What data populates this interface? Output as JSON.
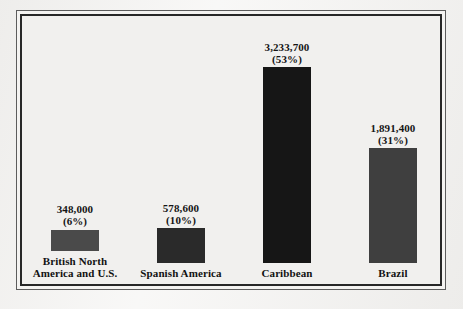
{
  "chart_data": {
    "type": "bar",
    "title": "",
    "subtitle": "",
    "xlabel": "",
    "ylabel": "",
    "grid": false,
    "legend": "none",
    "ylim": [
      0,
      3400000
    ],
    "categories": [
      "British North\nAmerica and U.S.",
      "Spanish America",
      "Caribbean",
      "Brazil"
    ],
    "values": [
      348000,
      578600,
      3233700,
      1891400
    ],
    "value_labels": [
      "348,000",
      "578,600",
      "3,233,700",
      "1,891,400"
    ],
    "percent_labels": [
      "(6%)",
      "(10%)",
      "(53%)",
      "(31%)"
    ],
    "percents": [
      6,
      10,
      53,
      31
    ],
    "bar_colors": [
      "#4a4a4a",
      "#2a2a2a",
      "#161616",
      "#3f3f3f"
    ]
  },
  "figure": {
    "background_color": "#f2f1ef",
    "frame_outer_color": "#5c5c5c",
    "frame_inner_color": "#272727"
  }
}
